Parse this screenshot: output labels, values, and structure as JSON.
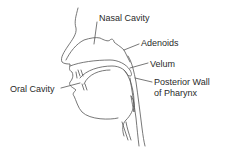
{
  "diagram": {
    "type": "anatomical cross-section (sagittal view of head)",
    "labels": {
      "nasal_cavity": "Nasal Cavity",
      "adenoids": "Adenoids",
      "velum": "Velum",
      "posterior_wall_line1": "Posterior Wall",
      "posterior_wall_line2": "of Pharynx",
      "oral_cavity": "Oral Cavity"
    }
  }
}
